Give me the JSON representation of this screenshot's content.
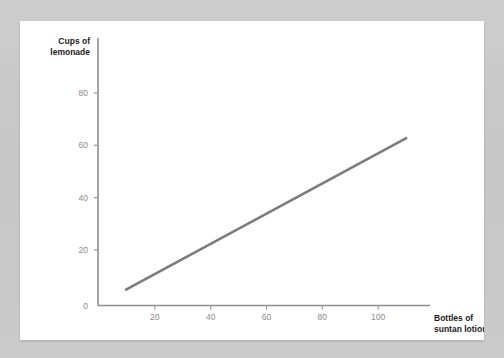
{
  "chart_data": {
    "type": "line",
    "title": "",
    "xlabel": "Bottles of suntan lotion",
    "xlabel_line1": "Bottles of",
    "xlabel_line2": "suntan lotion",
    "ylabel": "Cups of lemonade",
    "ylabel_line1": "Cups of",
    "ylabel_line2": "lemonade",
    "xlim": [
      0,
      120
    ],
    "ylim": [
      0,
      90
    ],
    "xticks": [
      0,
      20,
      40,
      60,
      80,
      100
    ],
    "xtick_labels": [
      "0",
      "20",
      "40",
      "60",
      "80",
      "100"
    ],
    "yticks": [
      20,
      40,
      60,
      80
    ],
    "ytick_labels": [
      "20",
      "40",
      "60",
      "80"
    ],
    "origin_label": "0",
    "grid": false,
    "legend": null,
    "series": [
      {
        "name": "lemonade sales",
        "x": [
          10,
          110
        ],
        "values": [
          6,
          63
        ],
        "color": "#7c7c7c"
      }
    ],
    "annotations": []
  },
  "colors": {
    "page_background": "#c9c9c9",
    "card_background": "#ffffff",
    "line": "#7c7c7c",
    "axis": "#8f8f8f",
    "tick_text": "#8c8c8c",
    "title_text": "#1b1b1b"
  }
}
